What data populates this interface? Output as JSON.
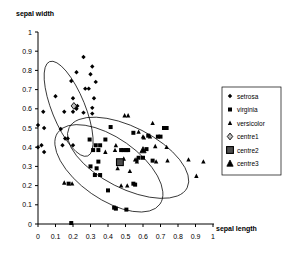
{
  "chart_data": {
    "type": "scatter",
    "title": "",
    "xlabel": "sepal length",
    "ylabel": "sepal width",
    "xlim": [
      0,
      1
    ],
    "ylim": [
      0,
      1
    ],
    "xticks": [
      "0",
      "0.1",
      "0.2",
      "0.3",
      "0.4",
      "0.5",
      "0.6",
      "0.7",
      "0.8",
      "0.9",
      "1"
    ],
    "yticks": [
      "0",
      "0.1",
      "0.2",
      "0.3",
      "0.4",
      "0.5",
      "0.6",
      "0.7",
      "0.8",
      "0.9",
      "1"
    ],
    "grid": false,
    "legend_position": "right",
    "series": [
      {
        "name": "setrosa",
        "marker": "diamond",
        "color": "#000000",
        "points": [
          [
            0.26,
            0.87
          ],
          [
            0.31,
            0.82
          ],
          [
            0.22,
            0.79
          ],
          [
            0.3,
            0.78
          ],
          [
            0.33,
            0.74
          ],
          [
            0.19,
            0.745
          ],
          [
            0.27,
            0.705
          ],
          [
            0.29,
            0.705
          ],
          [
            0.1,
            0.665
          ],
          [
            0.2,
            0.655
          ],
          [
            0.32,
            0.655
          ],
          [
            0.21,
            0.615
          ],
          [
            0.225,
            0.615
          ],
          [
            0.22,
            0.6
          ],
          [
            0.31,
            0.605
          ],
          [
            0.03,
            0.585
          ],
          [
            0.15,
            0.585
          ],
          [
            0.2,
            0.585
          ],
          [
            0.26,
            0.58
          ],
          [
            0.31,
            0.575
          ],
          [
            0.0,
            0.515
          ],
          [
            0.035,
            0.5
          ],
          [
            0.13,
            0.495
          ],
          [
            0.155,
            0.445
          ],
          [
            0.17,
            0.445
          ],
          [
            0.02,
            0.41
          ],
          [
            0.14,
            0.41
          ],
          [
            0.2,
            0.41
          ],
          [
            0.035,
            0.375
          ],
          [
            0.0,
            0.4
          ]
        ]
      },
      {
        "name": "virginia",
        "marker": "square",
        "color": "#000000",
        "points": [
          [
            0.415,
            0.505
          ],
          [
            0.385,
            0.44
          ],
          [
            0.295,
            0.44
          ],
          [
            0.33,
            0.41
          ],
          [
            0.355,
            0.41
          ],
          [
            0.315,
            0.385
          ],
          [
            0.345,
            0.385
          ],
          [
            0.475,
            0.385
          ],
          [
            0.49,
            0.385
          ],
          [
            0.505,
            0.385
          ],
          [
            0.515,
            0.385
          ],
          [
            0.3,
            0.3
          ],
          [
            0.335,
            0.29
          ],
          [
            0.345,
            0.325
          ],
          [
            0.325,
            0.255
          ],
          [
            0.355,
            0.255
          ],
          [
            0.575,
            0.345
          ],
          [
            0.6,
            0.345
          ],
          [
            0.655,
            0.33
          ],
          [
            0.685,
            0.455
          ],
          [
            0.72,
            0.5
          ],
          [
            0.735,
            0.5
          ],
          [
            0.7,
            0.455
          ],
          [
            0.63,
            0.46
          ],
          [
            0.545,
            0.475
          ],
          [
            0.545,
            0.21
          ],
          [
            0.555,
            0.205
          ],
          [
            0.4,
            0.175
          ],
          [
            0.435,
            0.085
          ],
          [
            0.445,
            0.08
          ],
          [
            0.505,
            0.075
          ],
          [
            0.19,
            0.005
          ],
          [
            0.175,
            0.21
          ],
          [
            0.62,
            0.39
          ]
        ]
      },
      {
        "name": "versicolor",
        "marker": "triangle",
        "color": "#000000",
        "points": [
          [
            0.495,
            0.565
          ],
          [
            0.515,
            0.565
          ],
          [
            0.655,
            0.525
          ],
          [
            0.575,
            0.48
          ],
          [
            0.64,
            0.455
          ],
          [
            0.605,
            0.45
          ],
          [
            0.735,
            0.4
          ],
          [
            0.67,
            0.405
          ],
          [
            0.445,
            0.41
          ],
          [
            0.44,
            0.385
          ],
          [
            0.385,
            0.375
          ],
          [
            0.48,
            0.385
          ],
          [
            0.555,
            0.335
          ],
          [
            0.565,
            0.335
          ],
          [
            0.565,
            0.325
          ],
          [
            0.86,
            0.335
          ],
          [
            0.945,
            0.325
          ],
          [
            0.905,
            0.25
          ],
          [
            0.74,
            0.33
          ],
          [
            0.675,
            0.325
          ],
          [
            0.525,
            0.275
          ],
          [
            0.455,
            0.29
          ],
          [
            0.475,
            0.2
          ],
          [
            0.51,
            0.2
          ],
          [
            0.15,
            0.215
          ],
          [
            0.195,
            0.21
          ],
          [
            0.6,
            0.455
          ],
          [
            0.49,
            0.34
          ]
        ]
      },
      {
        "name": "centre1",
        "marker": "open-diamond",
        "color": "#000000",
        "points": [
          [
            0.205,
            0.615
          ]
        ]
      },
      {
        "name": "centre2",
        "marker": "open-square",
        "color": "#000000",
        "points": [
          [
            0.468,
            0.322
          ]
        ]
      },
      {
        "name": "centre3",
        "marker": "open-triangle",
        "color": "#000000",
        "points": [
          [
            0.6,
            0.385
          ]
        ]
      }
    ],
    "ellipses": [
      {
        "name": "setrosa-ellipse",
        "cx": 0.175,
        "cy": 0.6,
        "rx": 0.095,
        "ry": 0.265,
        "rotate": -22
      },
      {
        "name": "virginia-ellipse",
        "cx": 0.405,
        "cy": 0.29,
        "rx": 0.175,
        "ry": 0.325,
        "rotate": -55
      },
      {
        "name": "versicolor-ellipse",
        "cx": 0.515,
        "cy": 0.345,
        "rx": 0.175,
        "ry": 0.345,
        "rotate": -63
      }
    ]
  },
  "legend": {
    "entries": [
      {
        "label": "setrosa"
      },
      {
        "label": "virginia"
      },
      {
        "label": "versicolor"
      },
      {
        "label": "centre1"
      },
      {
        "label": "centre2"
      },
      {
        "label": "centre3"
      }
    ]
  }
}
